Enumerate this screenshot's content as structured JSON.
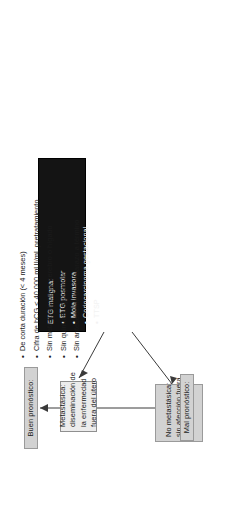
{
  "diagram": {
    "orientation": "rotated-90",
    "colors": {
      "gray_box": "#d2d2d2",
      "light_box": "#ececec",
      "black_box": "#141414",
      "connector": "#3a3a3a",
      "text_dark": "#1b1b1b",
      "text_light": "#f2f2f2"
    }
  },
  "nodes": {
    "source": {
      "name": "etg-maligna-box",
      "heading": "ETG maligna:",
      "items": [
        "ETG posmolar",
        "Mola invasora",
        "Coriocarcinoma gestacional",
        "TTSP"
      ]
    },
    "non_metastatic": {
      "name": "no-metastasica-box",
      "lines": [
        "No metastásica:",
        "sin afección fuera",
        "del útero"
      ]
    },
    "metastatic": {
      "name": "metastasica-box",
      "lines": [
        "Metastásica:",
        "diseminación de",
        "la enfermedad",
        "fuera del útero"
      ]
    },
    "good_prognosis": {
      "name": "buen-pronostico-box",
      "label": "Buen pronóstico:"
    },
    "bad_prognosis": {
      "name": "mal-pronostico-box",
      "label": "Mal pronóstico:"
    }
  },
  "criteria": {
    "name": "buen-pronostico-criterios",
    "items": [
      "De corta duración (< 4 meses)",
      "Cifra de hCG < 40 000 mUI/mL pretratamiento",
      "Sin metástasis hacia cerebro o hígado",
      "Sin quimioterapia previa",
      "Sin antecedente de embarazo a término"
    ]
  }
}
